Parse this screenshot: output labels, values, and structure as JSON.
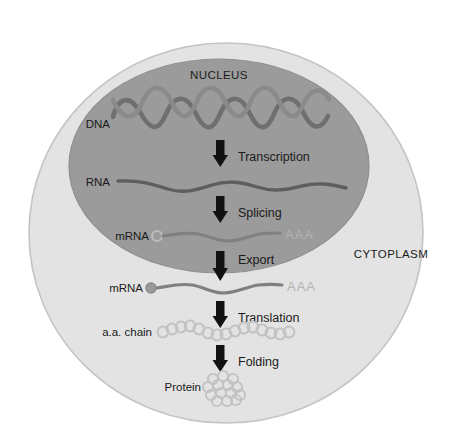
{
  "diagram": {
    "compartments": [
      {
        "id": "nucleus",
        "label": "NUCLEUS",
        "fill": "#9a9a9a"
      },
      {
        "id": "cytoplasm",
        "label": "CYTOPLASM",
        "fill": "#e2e2e2"
      }
    ],
    "molecule_labels": [
      {
        "id": "dna",
        "label": "DNA"
      },
      {
        "id": "rna",
        "label": "RNA"
      },
      {
        "id": "mrna-nuclear",
        "label": "mRNA"
      },
      {
        "id": "mrna-cytoplasmic",
        "label": "mRNA"
      },
      {
        "id": "aa-chain",
        "label": "a.a. chain"
      },
      {
        "id": "protein",
        "label": "Protein"
      }
    ],
    "steps": [
      {
        "id": "transcription",
        "label": "Transcription"
      },
      {
        "id": "splicing",
        "label": "Splicing"
      },
      {
        "id": "export",
        "label": "Export"
      },
      {
        "id": "translation",
        "label": "Translation"
      },
      {
        "id": "folding",
        "label": "Folding"
      }
    ],
    "poly_a_tails": [
      {
        "id": "poly-a-nuclear",
        "label": "AAA"
      },
      {
        "id": "poly-a-cytoplasmic",
        "label": "AAA"
      }
    ],
    "colors": {
      "background": "#ffffff",
      "cell_fill": "#e2e2e2",
      "cell_stroke": "#c6c6c6",
      "nucleus_fill": "#9a9a9a",
      "nucleus_stroke": "#8e8e8e",
      "dna_strand": "#6f6f6f",
      "rna_strand": "#5e5e5e",
      "mrna_strand": "#787878",
      "aaa_text": "#b4b4b4",
      "arrow": "#121212",
      "text": "#1a1a1a",
      "circle_outline": "#bdbdbd"
    }
  }
}
